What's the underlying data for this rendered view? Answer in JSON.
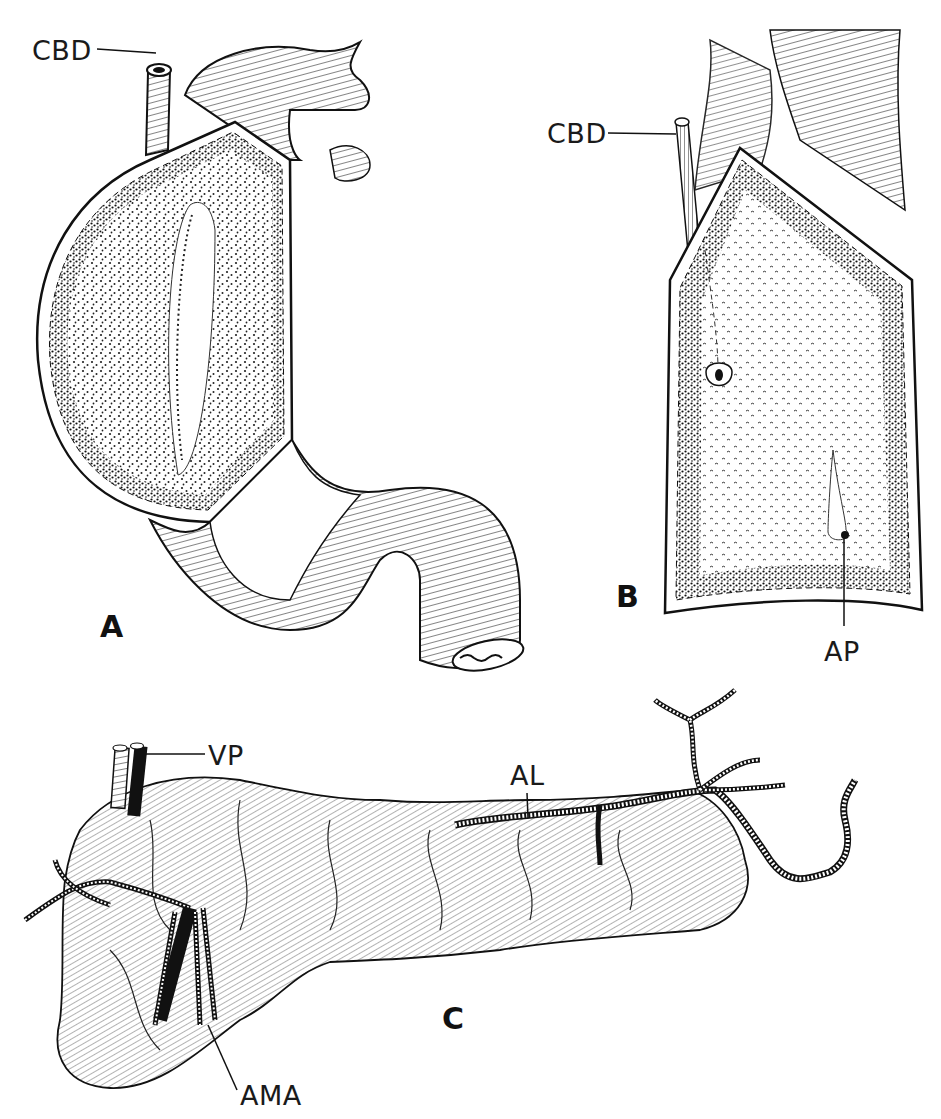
{
  "figure": {
    "top_caption_clipped": true,
    "panels": [
      {
        "id": "A",
        "letter": "A",
        "labels": [
          {
            "text": "CBD",
            "meaning": "common bile duct"
          }
        ]
      },
      {
        "id": "B",
        "letter": "B",
        "labels": [
          {
            "text": "CBD"
          },
          {
            "text": "AP"
          }
        ]
      },
      {
        "id": "C",
        "letter": "C",
        "labels": [
          {
            "text": "VP"
          },
          {
            "text": "AL"
          },
          {
            "text": "AMA"
          }
        ]
      }
    ]
  },
  "labels": {
    "a_cbd": "CBD",
    "b_cbd": "CBD",
    "b_ap": "AP",
    "c_vp": "VP",
    "c_al": "AL",
    "c_ama": "AMA"
  },
  "letters": {
    "a": "A",
    "b": "B",
    "c": "C"
  },
  "colors": {
    "ink": "#111111",
    "paper": "#ffffff",
    "stipple": "#2a2a2a"
  }
}
